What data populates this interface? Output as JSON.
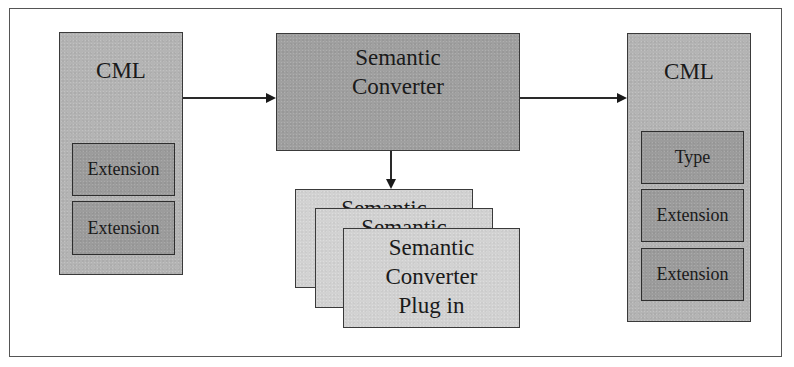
{
  "diagram": {
    "source_cml": {
      "title": "CML",
      "items": [
        "Extension",
        "Extension"
      ]
    },
    "converter": {
      "line1": "Semantic",
      "line2": "Converter"
    },
    "plugins": [
      {
        "line1": "Semantic",
        "line2": "Converter",
        "line3": "Plug in"
      },
      {
        "line1": "Semantic",
        "line2": "Converter",
        "line3": "Plug in"
      },
      {
        "line1": "Semantic",
        "line2": "Converter",
        "line3": "Plug in"
      }
    ],
    "target_cml": {
      "title": "CML",
      "items": [
        "Type",
        "Extension",
        "Extension"
      ]
    },
    "edges": [
      {
        "from": "source_cml",
        "to": "converter"
      },
      {
        "from": "converter",
        "to": "target_cml"
      },
      {
        "from": "converter",
        "to": "plugins"
      }
    ]
  },
  "colors": {
    "cml_fill": "#b4b4b4",
    "inner_fill": "#9c9c9c",
    "converter_fill": "#a0a0a0",
    "plugin_fill": "#d2d2d2",
    "stroke": "#3a3a3a"
  }
}
